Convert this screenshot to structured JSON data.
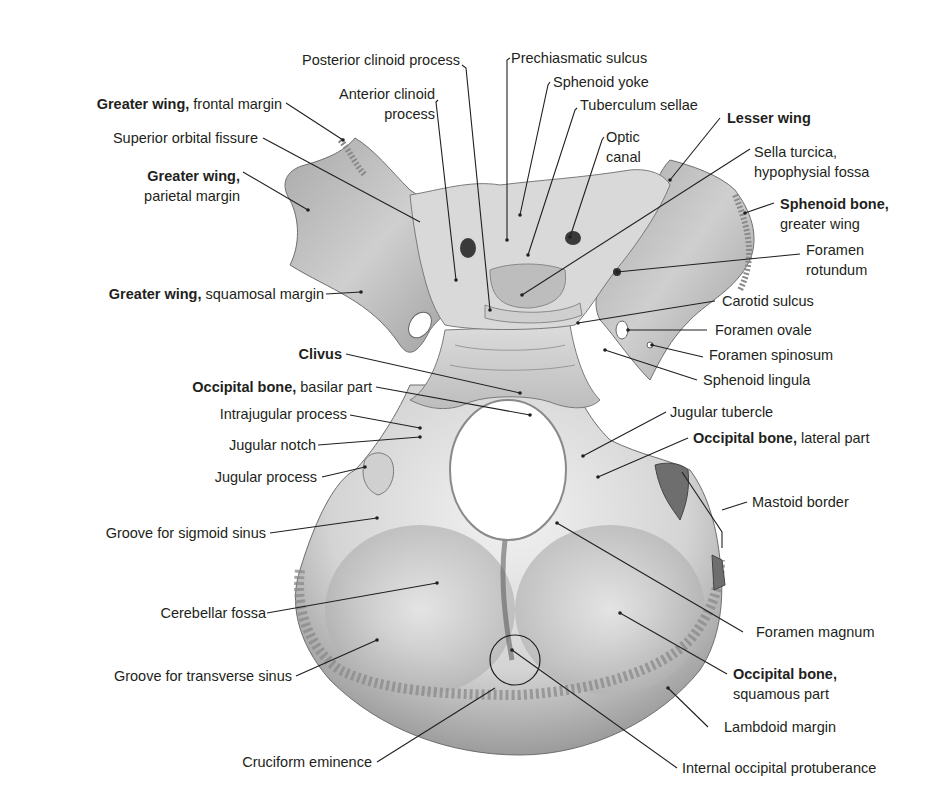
{
  "figure": {
    "colors": {
      "bone_light": "#e6e6e6",
      "bone_mid": "#b8b8b8",
      "bone_dark": "#7a7a7a",
      "leader": "#231f20",
      "label": "#231f20"
    }
  },
  "labels": {
    "posterior_clinoid": {
      "text": "Posterior clinoid process"
    },
    "prechiasmatic": {
      "text": "Prechiasmatic sulcus"
    },
    "sphenoid_yoke": {
      "text": "Sphenoid yoke"
    },
    "anterior_clinoid": {
      "line1": "Anterior clinoid",
      "line2": "process"
    },
    "tuberculum": {
      "text": "Tuberculum sellae"
    },
    "gw_frontal": {
      "bold": "Greater wing,",
      "normal": " frontal margin"
    },
    "lesser_wing": {
      "bold": "Lesser wing"
    },
    "optic_canal": {
      "line1": "Optic",
      "line2": "canal"
    },
    "sof": {
      "text": "Superior orbital fissure"
    },
    "sella": {
      "line1": "Sella turcica,",
      "line2": "hypophysial fossa"
    },
    "gw_parietal": {
      "bold": "Greater wing,",
      "line2": "parietal margin"
    },
    "sph_gw": {
      "bold": "Sphenoid bone,",
      "line2": "greater wing"
    },
    "f_rotundum": {
      "line1": "Foramen",
      "line2": "rotundum"
    },
    "gw_squamosal": {
      "bold": "Greater wing,",
      "normal": " squamosal margin"
    },
    "carotid": {
      "text": "Carotid sulcus"
    },
    "f_ovale": {
      "text": "Foramen ovale"
    },
    "clivus": {
      "bold": "Clivus"
    },
    "f_spinosum": {
      "text": "Foramen spinosum"
    },
    "basilar": {
      "bold": "Occipital bone,",
      "normal": " basilar part"
    },
    "lingula": {
      "text": "Sphenoid lingula"
    },
    "intrajugular": {
      "text": "Intrajugular process"
    },
    "jug_tubercle": {
      "text": "Jugular tubercle"
    },
    "jug_notch": {
      "text": "Jugular notch"
    },
    "lateral_part": {
      "bold": "Occipital bone,",
      "normal": " lateral part"
    },
    "jug_process": {
      "text": "Jugular process"
    },
    "mastoid": {
      "text": "Mastoid border"
    },
    "sigmoid": {
      "text": "Groove for sigmoid sinus"
    },
    "cerebellar": {
      "text": "Cerebellar fossa"
    },
    "f_magnum": {
      "text": "Foramen magnum"
    },
    "transverse": {
      "text": "Groove for transverse sinus"
    },
    "squamous": {
      "bold": "Occipital bone,",
      "line2": "squamous part"
    },
    "lambdoid": {
      "text": "Lambdoid margin"
    },
    "cruciform": {
      "text": "Cruciform eminence"
    },
    "iop": {
      "text": "Internal occipital protuberance"
    }
  }
}
